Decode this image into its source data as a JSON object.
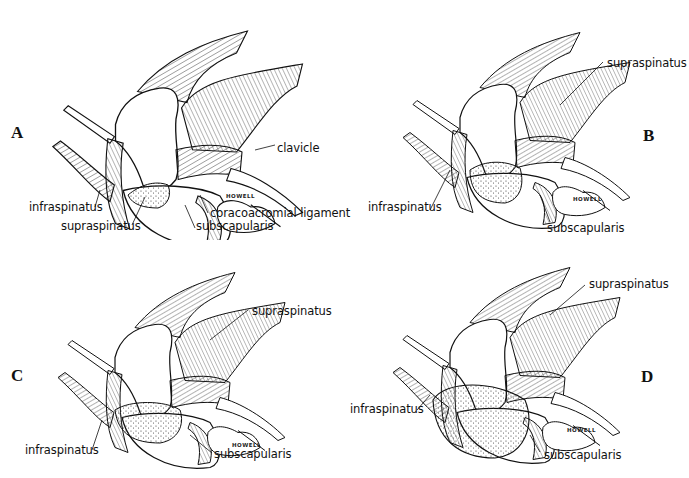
{
  "figure": {
    "panels": [
      {
        "id": "A",
        "letter": "A",
        "labels": {
          "clavicle": "clavicle",
          "infraspinatus": "infraspinatus",
          "coracoacromial_ligament": "coracoacromial ligament",
          "supraspinatus": "supraspinatus",
          "subscapularis": "subscapularis"
        },
        "signature": "HOWELL"
      },
      {
        "id": "B",
        "letter": "B",
        "labels": {
          "supraspinatus": "supraspinatus",
          "infraspinatus": "infraspinatus",
          "subscapularis": "subscapularis"
        },
        "signature": "HOWELL"
      },
      {
        "id": "C",
        "letter": "C",
        "labels": {
          "supraspinatus": "supraspinatus",
          "infraspinatus": "infraspinatus",
          "subscapularis": "subscapularis"
        },
        "signature": "HOWELL"
      },
      {
        "id": "D",
        "letter": "D",
        "labels": {
          "supraspinatus": "supraspinatus",
          "infraspinatus": "infraspinatus",
          "subscapularis": "subscapularis"
        },
        "signature": "HOWELL"
      }
    ]
  }
}
